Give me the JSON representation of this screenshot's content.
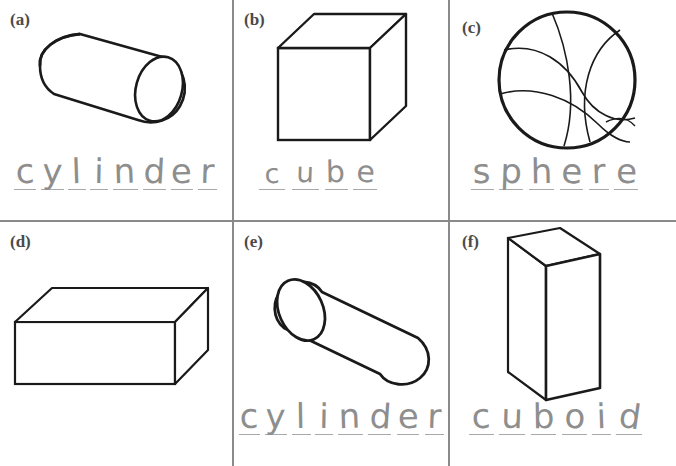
{
  "worksheet": {
    "title": "3D shapes naming worksheet",
    "background_color": "#ffffff",
    "ink_color": "#1a1a1a",
    "pencil_color": "#8e8e8e",
    "rule_color": "#a9a9a9",
    "divider_color": "#8a8a8a",
    "grid": {
      "rows": 2,
      "columns": 3
    }
  },
  "panels": [
    {
      "id": "a",
      "label": "(a)",
      "shape": "cylinder",
      "shape_icon": "cylinder-tilted-right-cap",
      "answer": "cylinder",
      "letters": [
        "c",
        "y",
        "l",
        "i",
        "n",
        "d",
        "e",
        "r"
      ]
    },
    {
      "id": "b",
      "label": "(b)",
      "shape": "cube",
      "shape_icon": "cube-isometric",
      "answer": "cube",
      "letters": [
        "c",
        "u",
        "b",
        "e"
      ]
    },
    {
      "id": "c",
      "label": "(c)",
      "shape": "sphere",
      "shape_icon": "sphere-basketball-seams",
      "answer": "sphere",
      "letters": [
        "s",
        "p",
        "h",
        "e",
        "r",
        "e"
      ]
    },
    {
      "id": "d",
      "label": "(d)",
      "shape": "cuboid",
      "shape_icon": "cuboid-wide-flat",
      "answer": "cuboid",
      "letters": [
        "c",
        "u",
        "b",
        "o",
        "i",
        "d"
      ]
    },
    {
      "id": "e",
      "label": "(e)",
      "shape": "cylinder",
      "shape_icon": "cylinder-tilted-left-cap",
      "answer": "cylinder",
      "letters": [
        "c",
        "y",
        "l",
        "i",
        "n",
        "d",
        "e",
        "r"
      ]
    },
    {
      "id": "f",
      "label": "(f)",
      "shape": "cuboid",
      "shape_icon": "cuboid-tall-vertical",
      "answer": "cuboid",
      "letters": [
        "c",
        "u",
        "b",
        "o",
        "i",
        "d"
      ]
    }
  ]
}
